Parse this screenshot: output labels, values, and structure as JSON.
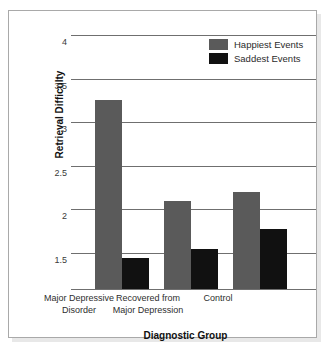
{
  "chart_data": {
    "type": "bar",
    "title": "",
    "xlabel": "Diagnostic Group",
    "ylabel": "Retrieval Difficulty",
    "categories": [
      "Major Depressive Disorder",
      "Recovered from Major Depression",
      "Control"
    ],
    "category_lines": [
      [
        "Major Depressive",
        "Disorder"
      ],
      [
        "Recovered from",
        "Major Depression"
      ],
      [
        "Control"
      ]
    ],
    "series": [
      {
        "name": "Happiest Events",
        "color": "#5a5a5a",
        "values": [
          3.25,
          2.1,
          2.2
        ]
      },
      {
        "name": "Saddest Events",
        "color": "#111111",
        "values": [
          1.45,
          1.55,
          1.78
        ]
      }
    ],
    "ylim": [
      1.09,
      4.0
    ],
    "yticks": [
      4,
      3.5,
      3,
      2.5,
      2,
      1.5
    ],
    "ytick_labels": [
      "4",
      "3.5",
      "3",
      "2.5",
      "2",
      "1.5"
    ],
    "grid": true,
    "legend_position": "top-right"
  },
  "legend": {
    "entries": [
      {
        "label": "Happiest Events",
        "color": "#5a5a5a"
      },
      {
        "label": "Saddest Events",
        "color": "#111111"
      }
    ]
  },
  "axes": {
    "x_title": "Diagnostic Group",
    "y_title": "Retrieval Difficulty",
    "y_tick_0": "4",
    "y_tick_1": "3.5",
    "y_tick_2": "3",
    "y_tick_3": "2.5",
    "y_tick_4": "2",
    "y_tick_5": "1.5"
  },
  "xlabels": {
    "g0_line0": "Major Depressive",
    "g0_line1": "Disorder",
    "g1_line0": "Recovered from",
    "g1_line1": "Major Depression",
    "g2_line0": "Control"
  },
  "style": {
    "frame_color": "#a9a9a9",
    "grid_color": "#6f6f6f",
    "background": "#ffffff"
  }
}
